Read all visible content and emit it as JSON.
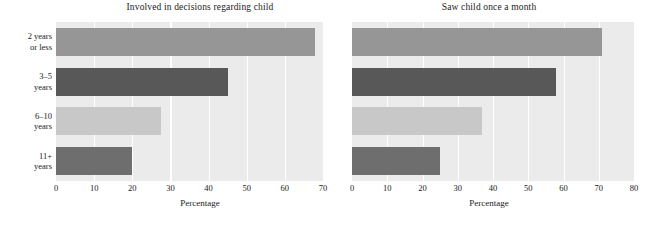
{
  "figure": {
    "categories": [
      "2 years or less",
      "3–5 years",
      "6–10 years",
      "11+ years"
    ],
    "category_lines": [
      {
        "l1": "2 years",
        "l2": "or less"
      },
      {
        "l1": "3–5",
        "l2": "years"
      },
      {
        "l1": "6–10",
        "l2": "years"
      },
      {
        "l1": "11+",
        "l2": "years"
      }
    ],
    "bar_colors": [
      "#969696",
      "#585858",
      "#c8c8c8",
      "#6e6e6e"
    ],
    "plot_background": "#ebebeb",
    "gridline_color": "#ffffff",
    "text_color": "#1a1a1a"
  },
  "panels": [
    {
      "title": "Involved in decisions regarding child",
      "xlabel": "Percentage",
      "ticks": [
        "0",
        "10",
        "20",
        "30",
        "40",
        "50",
        "60",
        "70"
      ],
      "values": [
        68,
        45,
        27.5,
        20
      ]
    },
    {
      "title": "Saw child once a month",
      "xlabel": "Percentage",
      "ticks": [
        "0",
        "10",
        "20",
        "30",
        "40",
        "50",
        "60",
        "70",
        "80"
      ],
      "values": [
        71,
        58,
        37,
        25
      ]
    }
  ],
  "chart_data": {
    "type": "bar",
    "orientation": "horizontal",
    "title": "",
    "categories": [
      "2 years or less",
      "3–5 years",
      "6–10 years",
      "11+ years"
    ],
    "panels": [
      {
        "title": "Involved in decisions regarding child",
        "xlabel": "Percentage",
        "ylabel": "",
        "xlim": [
          0,
          70
        ],
        "xticks": [
          0,
          10,
          20,
          30,
          40,
          50,
          60,
          70
        ],
        "values": [
          68,
          45,
          27.5,
          20
        ],
        "grid": "vertical",
        "legend": "none"
      },
      {
        "title": "Saw child once a month",
        "xlabel": "Percentage",
        "ylabel": "",
        "xlim": [
          0,
          80
        ],
        "xticks": [
          0,
          10,
          20,
          30,
          40,
          50,
          60,
          70,
          80
        ],
        "values": [
          71,
          58,
          37,
          25
        ],
        "grid": "vertical",
        "legend": "none"
      }
    ]
  }
}
